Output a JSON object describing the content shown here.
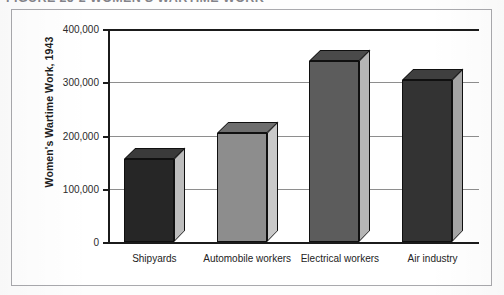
{
  "caption": {
    "text": "FIGURE 25-2    WOMEN'S WARTIME WORK"
  },
  "chart_data": {
    "type": "bar",
    "title": "",
    "xlabel": "",
    "ylabel": "Women's Wartime Work, 1943",
    "categories": [
      "Shipyards",
      "Automobile workers",
      "Electrical workers",
      "Air industry"
    ],
    "values": [
      155000,
      205000,
      340000,
      305000
    ],
    "ylim": [
      0,
      400000
    ],
    "ytick_values": [
      0,
      100000,
      200000,
      300000,
      400000
    ],
    "ytick_labels": [
      "0",
      "100,000",
      "200,000",
      "300,000",
      "400,000"
    ],
    "grid": true,
    "legend": "none",
    "style": "3d-column",
    "bar_colors": [
      "#262626",
      "#8d8d8d",
      "#5c5c5c",
      "#333333"
    ],
    "bar_top_colors": [
      "#3a3a3a",
      "#6e6e6e",
      "#4a4a4a",
      "#3f3f3f"
    ],
    "bar_side_colors": [
      "#bdbdbd",
      "#c9c9c9",
      "#b5b5b5",
      "#a5a5a5"
    ]
  },
  "axis": {
    "line_color": "#1b1b1b",
    "grid_color": "#8e8e8e"
  },
  "frame": {
    "border_color": "#a9a9ad"
  }
}
